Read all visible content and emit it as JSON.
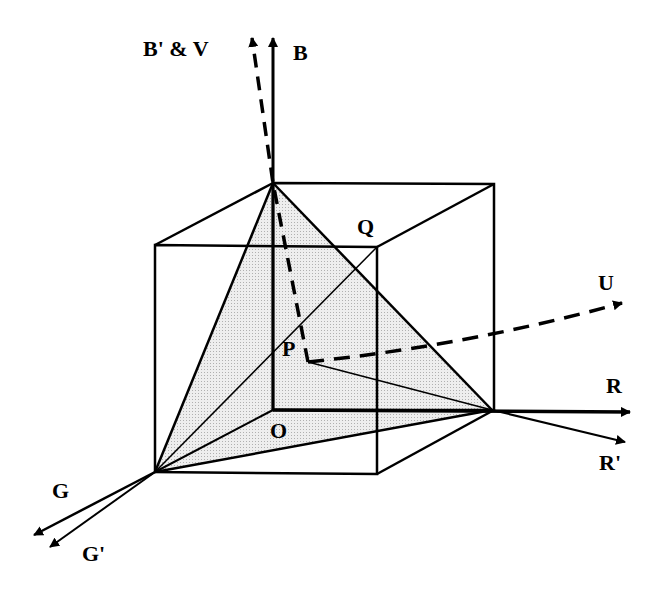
{
  "diagram": {
    "type": "rgb-color-cube-with-axes",
    "labels": {
      "b_prime_v": "B' & V",
      "b": "B",
      "q": "Q",
      "u": "U",
      "p": "P",
      "r": "R",
      "o": "O",
      "r_prime": "R'",
      "g": "G",
      "g_prime": "G'"
    },
    "points": {
      "O": [
        273,
        410
      ],
      "B_corner": [
        273,
        183
      ],
      "R_corner": [
        492,
        410
      ],
      "G_corner": [
        155,
        472
      ],
      "P": [
        308,
        362
      ],
      "Q": [
        377,
        247
      ]
    },
    "colors": {
      "stroke": "#000000",
      "shade": "#e4e4e4"
    }
  }
}
